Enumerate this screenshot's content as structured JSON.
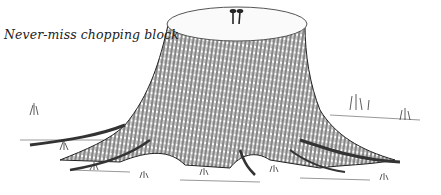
{
  "illustration": {
    "caption": "Never-miss chopping block",
    "subject": "tree-stump-with-two-nails",
    "colors": {
      "ink": "#222222",
      "paper": "#ffffff"
    }
  }
}
